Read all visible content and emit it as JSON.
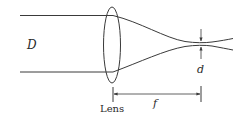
{
  "diagram": {
    "type": "lens-focusing-beam",
    "labels": {
      "beam_diameter": "D",
      "spot_diameter": "d",
      "lens": "Lens",
      "focal_length": "f"
    },
    "colors": {
      "line": "#3a3a3a",
      "text": "#2a2a2a",
      "background": "#ffffff"
    }
  }
}
